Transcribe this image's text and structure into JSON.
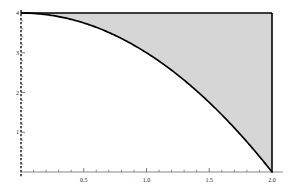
{
  "chart_data": {
    "type": "area",
    "title": "",
    "xlabel": "",
    "ylabel": "",
    "xlim": [
      0,
      2
    ],
    "ylim": [
      0,
      4
    ],
    "grid": false,
    "legend": null,
    "function": "y = 4 - x^2",
    "shaded_region": {
      "description": "Region between the curve y = 4 - x^2 and the horizontal line y = 4, from x = 0 to x = 2",
      "fill_color": "#d6d6d6",
      "upper_bound": 4,
      "lower_bound_function": "4 - x^2"
    },
    "x": [
      0,
      0.1,
      0.2,
      0.3,
      0.4,
      0.5,
      0.6,
      0.7,
      0.8,
      0.9,
      1.0,
      1.1,
      1.2,
      1.3,
      1.4,
      1.5,
      1.6,
      1.7,
      1.8,
      1.9,
      2.0
    ],
    "y": [
      4,
      3.99,
      3.96,
      3.91,
      3.84,
      3.75,
      3.64,
      3.51,
      3.36,
      3.19,
      3.0,
      2.79,
      2.56,
      2.31,
      2.04,
      1.75,
      1.44,
      1.11,
      0.76,
      0.39,
      0
    ],
    "curve_color": "#000000",
    "x_ticks_major": [
      {
        "value": 0.5,
        "label": "0.5"
      },
      {
        "value": 1.0,
        "label": "1.0"
      },
      {
        "value": 1.5,
        "label": "1.5"
      },
      {
        "value": 2.0,
        "label": "2.0"
      }
    ],
    "x_ticks_minor": [
      0.1,
      0.2,
      0.3,
      0.4,
      0.6,
      0.7,
      0.8,
      0.9,
      1.1,
      1.2,
      1.3,
      1.4,
      1.6,
      1.7,
      1.8,
      1.9
    ],
    "y_ticks_major": [
      {
        "value": 1,
        "label": "1"
      },
      {
        "value": 2,
        "label": "2"
      },
      {
        "value": 3,
        "label": "3"
      },
      {
        "value": 4,
        "label": "4"
      }
    ],
    "y_ticks_minor": [
      0.2,
      0.4,
      0.6,
      0.8,
      1.2,
      1.4,
      1.6,
      1.8,
      2.2,
      2.4,
      2.6,
      2.8,
      3.2,
      3.4,
      3.6,
      3.8
    ],
    "axes": {
      "left_axis_style": "dashed",
      "bottom_axis_style": "solid",
      "top_border_style": "solid",
      "right_border_style": "solid",
      "axis_color": "#000000"
    }
  }
}
